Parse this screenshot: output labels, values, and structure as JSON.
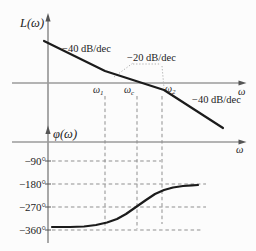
{
  "figure": {
    "magnitude": {
      "ylabel": "L(ω)",
      "xlabel": "ω",
      "slope_labels": [
        {
          "text": "−40 dB/dec"
        },
        {
          "text": "−20 dB/dec"
        },
        {
          "text": "−40 dB/dec"
        }
      ],
      "x_markers": [
        {
          "base": "ω",
          "sub": "1"
        },
        {
          "base": "ω",
          "sub": "c"
        },
        {
          "base": "ω",
          "sub": "2"
        }
      ]
    },
    "phase": {
      "ylabel": "φ(ω)",
      "xlabel": "ω",
      "yticks": [
        "−90°",
        "−180°",
        "−270°",
        "−360°"
      ]
    }
  },
  "chart_data": [
    {
      "type": "line",
      "name": "log-magnitude-plot",
      "title": "",
      "xlabel": "ω",
      "ylabel": "L(ω)",
      "x_scale": "logarithmic, no numeric ticks shown",
      "x_markers": [
        "ω1",
        "ωc",
        "ω2"
      ],
      "segments": [
        {
          "range": "ω < ω1",
          "slope_label": "−40 dB/dec"
        },
        {
          "range": "ω1 to ω2",
          "slope_label": "−20 dB/dec",
          "note": "crosses 0 dB at ωc"
        },
        {
          "range": "ω > ω2",
          "slope_label": "−40 dB/dec"
        }
      ]
    },
    {
      "type": "line",
      "name": "phase-plot",
      "title": "",
      "xlabel": "ω",
      "ylabel": "φ(ω)",
      "yticks": [
        "−90°",
        "−180°",
        "−270°",
        "−360°"
      ],
      "series": [
        {
          "name": "φ(ω)",
          "points_deg": [
            {
              "x": "ω→0",
              "y": -350
            },
            {
              "x": "ω1",
              "y": -333
            },
            {
              "x": "ωc",
              "y": -270
            },
            {
              "x": "ω2",
              "y": -203
            },
            {
              "x": "ω→∞",
              "y": -184
            }
          ]
        }
      ]
    }
  ],
  "geometry": {
    "lines": [
      {
        "n": "shared-vertical-axis",
        "c": "axis",
        "x1": 48,
        "y1": 17,
        "x2": 48,
        "y2": 243
      },
      {
        "n": "magnitude-zero-db-axis",
        "c": "haxis",
        "x1": 12,
        "y1": 83,
        "x2": 241,
        "y2": 83
      },
      {
        "n": "phase-horizontal-axis",
        "c": "haxis",
        "x1": 12,
        "y1": 142,
        "x2": 241,
        "y2": 142
      },
      {
        "n": "dashed-vertical-w1",
        "c": "dashed",
        "x1": 105,
        "y1": 96,
        "x2": 105,
        "y2": 229
      },
      {
        "n": "dashed-vertical-wc",
        "c": "dashed",
        "x1": 137,
        "y1": 96,
        "x2": 137,
        "y2": 229
      },
      {
        "n": "dashed-vertical-w2",
        "c": "dashed",
        "x1": 162,
        "y1": 96,
        "x2": 162,
        "y2": 224
      },
      {
        "n": "dashed-gridline-minus90",
        "c": "dashed",
        "x1": 52,
        "y1": 161,
        "x2": 161,
        "y2": 161
      },
      {
        "n": "dashed-gridline-minus180",
        "c": "dashed",
        "x1": 52,
        "y1": 184,
        "x2": 206,
        "y2": 184
      },
      {
        "n": "dashed-gridline-minus270",
        "c": "dashed",
        "x1": 52,
        "y1": 207,
        "x2": 206,
        "y2": 207
      },
      {
        "n": "dashed-gridline-minus360",
        "c": "dashed",
        "x1": 52,
        "y1": 230,
        "x2": 203,
        "y2": 230
      },
      {
        "n": "tick-minus90",
        "c": "tick",
        "x1": 45,
        "y1": 161,
        "x2": 51,
        "y2": 161
      },
      {
        "n": "tick-minus180",
        "c": "tick",
        "x1": 45,
        "y1": 184,
        "x2": 51,
        "y2": 184
      },
      {
        "n": "tick-minus270",
        "c": "tick",
        "x1": 45,
        "y1": 207,
        "x2": 51,
        "y2": 207
      },
      {
        "n": "tick-minus360",
        "c": "tick",
        "x1": 45,
        "y1": 230,
        "x2": 51,
        "y2": 230
      },
      {
        "n": "leader-dotted-diagonal",
        "c": "dotted",
        "x1": 114,
        "y1": 77,
        "x2": 133,
        "y2": 63
      },
      {
        "n": "leader-dotted-horizontal",
        "c": "dotted",
        "x1": 133,
        "y1": 64,
        "x2": 161,
        "y2": 64
      },
      {
        "n": "leader-dotted-vertical",
        "c": "dotted",
        "x1": 162,
        "y1": 66,
        "x2": 164,
        "y2": 88
      }
    ],
    "polylines": [
      {
        "n": "magnitude-curve",
        "c": "curve",
        "pts": "44,41 105,71 164,90 223,128"
      },
      {
        "n": "phase-curve",
        "c": "curve",
        "pts": "52,227 70,227 84,226.5 96,225 107,222.5 117,219 126,214 136,207 146,200 155,194 164,190 173,187.5 183,186 192,185.3 198,185"
      }
    ],
    "arrows": [
      {
        "n": "magnitude-yaxis-arrowhead",
        "pts": "48,13 45.4,21.5 50.6,21.5"
      },
      {
        "n": "phase-yaxis-arrowhead",
        "pts": "48,125.5 45.4,134 50.6,134"
      },
      {
        "n": "magnitude-xaxis-arrowhead",
        "pts": "246.5,83 238.5,80.6 238.5,85.4"
      },
      {
        "n": "phase-xaxis-arrowhead",
        "pts": "246.5,142 238.5,139.6 238.5,144.4"
      }
    ]
  }
}
